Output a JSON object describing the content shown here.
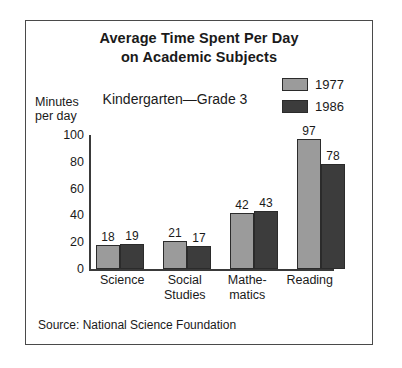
{
  "figure": {
    "title_line1": "Average Time Spent Per Day",
    "title_line2": "on Academic Subjects",
    "subtitle": "Kindergarten—Grade 3",
    "axis_title_line1": "Minutes",
    "axis_title_line2": "per day",
    "source": "Source: National Science Foundation"
  },
  "legend": {
    "items": [
      {
        "label": "1977",
        "color": "#9b9b9b"
      },
      {
        "label": "1986",
        "color": "#3c3c3c"
      }
    ]
  },
  "axis": {
    "ticks": [
      "100",
      "80",
      "60",
      "40",
      "20",
      "0"
    ]
  },
  "categories_display": [
    {
      "line1": "Science",
      "line2": ""
    },
    {
      "line1": "Social",
      "line2": "Studies"
    },
    {
      "line1": "Mathe-",
      "line2": "matics"
    },
    {
      "line1": "Reading",
      "line2": ""
    }
  ],
  "chart_data": {
    "type": "bar",
    "title": "Average Time Spent Per Day on Academic Subjects",
    "subtitle": "Kindergarten—Grade 3",
    "xlabel": "",
    "ylabel": "Minutes per day",
    "ylim": [
      0,
      100
    ],
    "yticks": [
      0,
      20,
      40,
      60,
      80,
      100
    ],
    "grid": false,
    "legend_position": "top-right",
    "categories": [
      "Science",
      "Social Studies",
      "Mathematics",
      "Reading"
    ],
    "series": [
      {
        "name": "1977",
        "color": "#9b9b9b",
        "values": [
          18,
          21,
          42,
          97
        ]
      },
      {
        "name": "1986",
        "color": "#3c3c3c",
        "values": [
          19,
          17,
          43,
          78
        ]
      }
    ],
    "source": "Source: National Science Foundation"
  }
}
